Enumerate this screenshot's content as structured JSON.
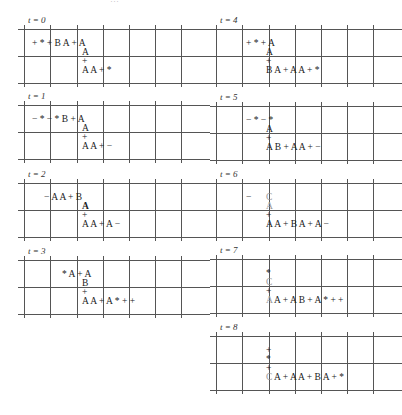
{
  "top_strip": "…",
  "panels": [
    {
      "label": "t = 0",
      "col": 0,
      "top": 29,
      "items": [
        {
          "x": 8,
          "y": 10,
          "t": "+ * + B A + A"
        },
        {
          "x": 58,
          "y": 19,
          "t": "A"
        },
        {
          "x": 58,
          "y": 28,
          "t": "+"
        },
        {
          "x": 58,
          "y": 37,
          "t": "A A + *"
        }
      ]
    },
    {
      "label": "t = 1",
      "col": 0,
      "top": 105,
      "items": [
        {
          "x": 8,
          "y": 10,
          "t": "− * − * B + A"
        },
        {
          "x": 58,
          "y": 19,
          "t": "A"
        },
        {
          "x": 58,
          "y": 28,
          "t": "+"
        },
        {
          "x": 58,
          "y": 37,
          "t": "A A + −"
        }
      ]
    },
    {
      "label": "t = 2",
      "col": 0,
      "top": 183,
      "items": [
        {
          "x": 20,
          "y": 10,
          "t": "−    A A + B"
        },
        {
          "x": 58,
          "y": 19,
          "t": "A",
          "cls": "b"
        },
        {
          "x": 58,
          "y": 28,
          "t": "+"
        },
        {
          "x": 58,
          "y": 37,
          "t": "A A + A −"
        }
      ]
    },
    {
      "label": "t = 3",
      "col": 0,
      "top": 260,
      "items": [
        {
          "x": 38,
          "y": 10,
          "t": "* A + A"
        },
        {
          "x": 58,
          "y": 19,
          "t": "B"
        },
        {
          "x": 58,
          "y": 28,
          "t": "+"
        },
        {
          "x": 58,
          "y": 37,
          "t": "A A + A * + +"
        }
      ]
    },
    {
      "label": "t = 4",
      "col": 1,
      "top": 29,
      "items": [
        {
          "x": 30,
          "y": 10,
          "t": "+ * + A"
        },
        {
          "x": 50,
          "y": 19,
          "t": "A"
        },
        {
          "x": 50,
          "y": 28,
          "t": "+"
        },
        {
          "x": 50,
          "y": 37,
          "t": "B A + A A + *"
        }
      ]
    },
    {
      "label": "t = 5",
      "col": 1,
      "top": 106,
      "items": [
        {
          "x": 30,
          "y": 10,
          "t": "− * − *"
        },
        {
          "x": 50,
          "y": 19,
          "t": "A"
        },
        {
          "x": 50,
          "y": 28,
          "t": "+"
        },
        {
          "x": 50,
          "y": 37,
          "t": "A B + A A + −"
        }
      ]
    },
    {
      "label": "t = 6",
      "col": 1,
      "top": 183,
      "items": [
        {
          "x": 30,
          "y": 10,
          "t": "−"
        },
        {
          "x": 50,
          "y": 10,
          "t": "C",
          "cls": "g"
        },
        {
          "x": 50,
          "y": 19,
          "t": "A",
          "cls": "g"
        },
        {
          "x": 50,
          "y": 28,
          "t": "+"
        },
        {
          "x": 50,
          "y": 37,
          "t": "A A + B A + A −"
        }
      ]
    },
    {
      "label": "t = 7",
      "col": 1,
      "top": 259,
      "items": [
        {
          "x": 50,
          "y": 10,
          "t": "*"
        },
        {
          "x": 50,
          "y": 19,
          "t": "C",
          "cls": "g"
        },
        {
          "x": 50,
          "y": 28,
          "t": "+"
        },
        {
          "x": 50,
          "y": 37,
          "t": "A",
          "cls": "g"
        },
        {
          "x": 58,
          "y": 37,
          "t": "A + A B + A * + +"
        }
      ]
    },
    {
      "label": "t = 8",
      "col": 1,
      "top": 336,
      "items": [
        {
          "x": 50,
          "y": 10,
          "t": "+"
        },
        {
          "x": 50,
          "y": 19,
          "t": "*"
        },
        {
          "x": 50,
          "y": 28,
          "t": "+"
        },
        {
          "x": 50,
          "y": 37,
          "t": "C",
          "cls": "g"
        },
        {
          "x": 58,
          "y": 37,
          "t": "A + A A + B A + *"
        }
      ]
    }
  ]
}
